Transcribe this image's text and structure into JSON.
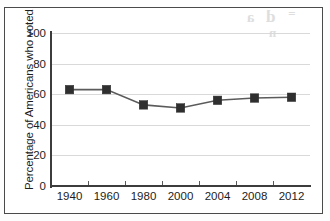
{
  "chart_data": {
    "type": "line",
    "title": "",
    "xlabel": "",
    "ylabel": "Percentage of Americans who voted",
    "categories": [
      "1940",
      "1960",
      "1980",
      "2000",
      "2004",
      "2008",
      "2012"
    ],
    "values": [
      63,
      63,
      53,
      51,
      56,
      57.5,
      58
    ],
    "series": [
      {
        "name": "Percentage of Americans who voted",
        "values": [
          63,
          63,
          53,
          51,
          56,
          57.5,
          58
        ]
      }
    ],
    "ylim": [
      0,
      100
    ],
    "yticks": [
      "0",
      "20",
      "40",
      "60",
      "80",
      "100"
    ],
    "ytick_values": [
      0,
      20,
      40,
      60,
      80,
      100
    ],
    "grid": "horizontal",
    "legend": "none",
    "marker": "square",
    "colors": {
      "line": "#5b5b5b",
      "marker": "#2f2f2f",
      "gridline": "#d9d9d9",
      "axis": "#3c3c3c",
      "text": "#1d1d1d",
      "background": "#ffffff"
    }
  },
  "artifacts": {
    "bleed_a": "a",
    "bleed_b": "d",
    "bleed_c": "=",
    "bleed_d": "n"
  }
}
